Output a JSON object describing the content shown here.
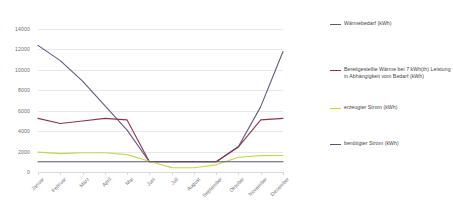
{
  "chart_data": {
    "type": "line",
    "title": "",
    "xlabel": "",
    "ylabel": "",
    "categories": [
      "Januar",
      "Februar",
      "März",
      "April",
      "Mai",
      "Juni",
      "Juli",
      "August",
      "September",
      "Oktober",
      "November",
      "Dezember"
    ],
    "ylim": [
      0,
      14000
    ],
    "yticks": [
      0,
      2000,
      4000,
      6000,
      8000,
      10000,
      12000,
      14000
    ],
    "ytick_labels": [
      "0",
      "2000",
      "4000",
      "6000",
      "8000",
      "10000",
      "12000",
      "14000"
    ],
    "grid": true,
    "legend_position": "right",
    "series": [
      {
        "name": "Wärmebedarf (kWh)",
        "color": "#5f5b7d",
        "values": [
          12400,
          10900,
          8900,
          6500,
          4100,
          1000,
          1000,
          1000,
          1000,
          2500,
          6400,
          11800
        ]
      },
      {
        "name": "Bereitgestellte Wärme bei 7 kWh(th) Leistung in Abhängigkeit vom Bedarf (kWh)",
        "color": "#8c3550",
        "values": [
          5250,
          4750,
          5000,
          5250,
          5100,
          1000,
          1000,
          1000,
          1000,
          2450,
          5100,
          5250
        ]
      },
      {
        "name": "erzeugter Strom (kWh)",
        "color": "#c4d64f",
        "values": [
          1950,
          1800,
          1880,
          1880,
          1700,
          1050,
          430,
          420,
          700,
          1450,
          1600,
          1620
        ]
      },
      {
        "name": "benötigter Strom (kWh)",
        "color": "#55557a",
        "values": [
          1000,
          1000,
          1000,
          1000,
          1000,
          1000,
          1000,
          1000,
          1000,
          1000,
          1000,
          1000
        ]
      }
    ]
  },
  "legend": {
    "entries": [
      {
        "label": "Wärmebedarf (kWh)",
        "color": "#5f5b7d"
      },
      {
        "label": "Bereitgestellte Wärme bei 7 kWh(th) Leistung in Abhängigkeit vom Bedarf (kWh)",
        "color": "#8c3550"
      },
      {
        "label": "erzeugter Strom (kWh)",
        "color": "#c4d64f"
      },
      {
        "label": "benötigter Strom (kWh)",
        "color": "#55557a"
      }
    ]
  }
}
